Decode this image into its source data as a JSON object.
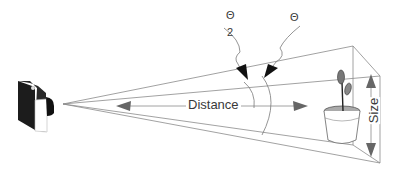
{
  "diagram": {
    "type": "field-of-view illustration",
    "labels": {
      "distance": "Distance",
      "size": "Size",
      "half_angle_numerator": "Θ",
      "half_angle_denominator": "2",
      "full_angle": "Θ"
    },
    "elements": [
      "camera",
      "view-frustum",
      "potted-plant",
      "distance-arrow",
      "size-arrow",
      "half-angle-arc",
      "full-angle-arc"
    ],
    "colors": {
      "line": "#8a8a8a",
      "arrow": "#6a6a6a",
      "camera": "#1a1a1a",
      "text": "#3a3a3a",
      "background": "#ffffff"
    }
  }
}
